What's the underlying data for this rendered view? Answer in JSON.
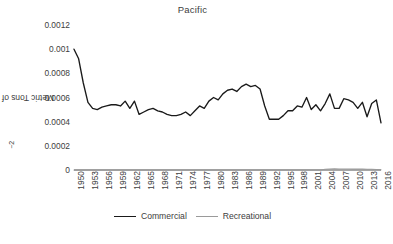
{
  "chart": {
    "title": "Pacific",
    "ylabel_text": "Metric Tons of Landings km",
    "ylabel_sup": "−2",
    "ylabel_full": "Metric Tons of Landings km⁻²"
  },
  "legend": {
    "items": [
      {
        "label": "Commercial",
        "color": "#1a1a1a"
      },
      {
        "label": "Recreational",
        "color": "#9a9a9a"
      }
    ]
  },
  "colors": {
    "commercial": "#1a1a1a",
    "recreational": "#9a9a9a",
    "axis": "#4d4d4d",
    "text": "#404040",
    "background": "#ffffff"
  },
  "chart_data": {
    "type": "line",
    "title": "Pacific",
    "xlabel": "",
    "ylabel": "Metric Tons of Landings km⁻²",
    "xlim": [
      1950,
      2016
    ],
    "ylim": [
      0,
      0.0012
    ],
    "grid": false,
    "legend_position": "bottom",
    "ytick_values": [
      0,
      0.0002,
      0.0004,
      0.0006,
      0.0008,
      0.001,
      0.0012
    ],
    "ytick_labels": [
      "0",
      "0.0002",
      "0.0004",
      "0.0006",
      "0.0008",
      "0.001",
      "0.0012"
    ],
    "xtick_values": [
      1950,
      1953,
      1956,
      1959,
      1962,
      1965,
      1968,
      1971,
      1974,
      1977,
      1980,
      1983,
      1986,
      1989,
      1992,
      1995,
      1998,
      2001,
      2004,
      2007,
      2010,
      2013,
      2016
    ],
    "xtick_labels": [
      "1950",
      "1953",
      "1956",
      "1959",
      "1962",
      "1965",
      "1968",
      "1971",
      "1974",
      "1977",
      "1980",
      "1983",
      "1986",
      "1989",
      "1992",
      "1995",
      "1998",
      "2001",
      "2004",
      "2007",
      "2010",
      "2013",
      "2016"
    ],
    "x": [
      1950,
      1951,
      1952,
      1953,
      1954,
      1955,
      1956,
      1957,
      1958,
      1959,
      1960,
      1961,
      1962,
      1963,
      1964,
      1965,
      1966,
      1967,
      1968,
      1969,
      1970,
      1971,
      1972,
      1973,
      1974,
      1975,
      1976,
      1977,
      1978,
      1979,
      1980,
      1981,
      1982,
      1983,
      1984,
      1985,
      1986,
      1987,
      1988,
      1989,
      1990,
      1991,
      1992,
      1993,
      1994,
      1995,
      1996,
      1997,
      1998,
      1999,
      2000,
      2001,
      2002,
      2003,
      2004,
      2005,
      2006,
      2007,
      2008,
      2009,
      2010,
      2011,
      2012,
      2013,
      2014,
      2015,
      2016
    ],
    "series": [
      {
        "name": "Commercial",
        "color": "#1a1a1a",
        "values": [
          0.001,
          0.00092,
          0.00072,
          0.00056,
          0.00051,
          0.0005,
          0.00052,
          0.00053,
          0.00054,
          0.00054,
          0.00053,
          0.00057,
          0.00051,
          0.00057,
          0.00046,
          0.00048,
          0.0005,
          0.00051,
          0.00049,
          0.00048,
          0.00046,
          0.00045,
          0.00045,
          0.00046,
          0.00048,
          0.00045,
          0.00049,
          0.00053,
          0.00051,
          0.00057,
          0.0006,
          0.00058,
          0.00063,
          0.00066,
          0.00067,
          0.00065,
          0.00069,
          0.00071,
          0.00069,
          0.0007,
          0.00067,
          0.00053,
          0.00042,
          0.00042,
          0.00042,
          0.00045,
          0.00049,
          0.00049,
          0.00053,
          0.00052,
          0.0006,
          0.0005,
          0.00054,
          0.00049,
          0.00055,
          0.00063,
          0.00051,
          0.00051,
          0.00059,
          0.00058,
          0.00056,
          0.00051,
          0.00056,
          0.00044,
          0.00055,
          0.00058,
          0.00039
        ]
      },
      {
        "name": "Recreational",
        "color": "#9a9a9a",
        "values": [
          0.0,
          0.0,
          0.0,
          0.0,
          0.0,
          0.0,
          0.0,
          0.0,
          0.0,
          0.0,
          0.0,
          0.0,
          0.0,
          0.0,
          0.0,
          0.0,
          0.0,
          0.0,
          0.0,
          0.0,
          0.0,
          0.0,
          0.0,
          0.0,
          0.0,
          0.0,
          0.0,
          0.0,
          0.0,
          0.0,
          0.0,
          0.0,
          0.0,
          0.0,
          0.0,
          0.0,
          0.0,
          0.0,
          0.0,
          0.0,
          0.0,
          0.0,
          0.0,
          0.0,
          0.0,
          0.0,
          0.0,
          0.0,
          0.0,
          0.0,
          0.0,
          0.0,
          0.0,
          0.0,
          6e-06,
          8.5e-06,
          9e-06,
          8.5e-06,
          8e-06,
          8e-06,
          7.5e-06,
          7.5e-06,
          7e-06,
          6.5e-06,
          6e-06,
          4.5e-06,
          2.5e-06
        ]
      }
    ]
  }
}
